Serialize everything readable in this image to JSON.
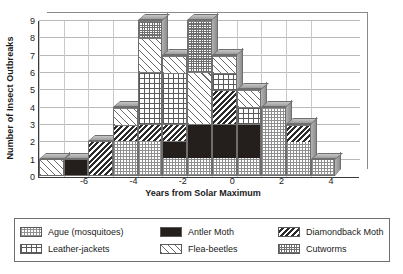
{
  "chart_data": {
    "type": "bar",
    "subtype": "stacked-bar",
    "title": "",
    "xlabel": "Years from Solar Maximum",
    "ylabel": "Number of Insect Outbreaks",
    "xlim": [
      -7.5,
      5.5
    ],
    "ylim": [
      0,
      9
    ],
    "ytick_labels": [
      "0",
      "1",
      "2",
      "3",
      "4",
      "5",
      "6",
      "7",
      "8",
      "9"
    ],
    "ytick_values": [
      0,
      1,
      2,
      3,
      4,
      5,
      6,
      7,
      8,
      9
    ],
    "xtick_labels": [
      "-6",
      "-4",
      "-2",
      "0",
      "2",
      "4"
    ],
    "xtick_values": [
      -6,
      -4,
      -2,
      0,
      2,
      4
    ],
    "categories": [
      -7,
      -6,
      -5,
      -4,
      -3,
      -2,
      -1,
      0,
      1,
      2,
      3,
      4
    ],
    "grid": "horizontal-and-vertical",
    "legend_position": "below-plot",
    "series": [
      {
        "name": "Ague (mosquitoes)",
        "pattern": "fine-checkerboard",
        "values": [
          0,
          0,
          0,
          2,
          2,
          1,
          1,
          1,
          1,
          4,
          2,
          1
        ]
      },
      {
        "name": "Antler Moth",
        "pattern": "solid-black",
        "values": [
          0,
          1,
          0,
          0,
          0,
          1,
          2,
          2,
          2,
          0,
          0,
          0
        ]
      },
      {
        "name": "Diamondback Moth",
        "pattern": "dense-diagonal-hatch",
        "values": [
          0,
          0,
          2,
          1,
          1,
          1,
          0,
          2,
          0,
          0,
          1,
          0
        ]
      },
      {
        "name": "Leather-jackets",
        "pattern": "grid-crosshatch",
        "values": [
          0,
          0,
          0,
          0,
          3,
          3,
          0,
          1,
          1,
          0,
          0,
          0
        ]
      },
      {
        "name": "Flea-beetles",
        "pattern": "sparse-diagonal-stripe",
        "values": [
          1,
          0,
          0,
          1,
          2,
          1,
          3,
          1,
          1,
          0,
          0,
          0
        ]
      },
      {
        "name": "Cutworms",
        "pattern": "dense-checkerboard",
        "values": [
          0,
          0,
          0,
          0,
          1,
          0,
          3,
          0,
          0,
          0,
          0,
          0
        ]
      }
    ],
    "stack_order_bottom_to_top": [
      "Ague (mosquitoes)",
      "Antler Moth",
      "Diamondback Moth",
      "Leather-jackets",
      "Flea-beetles",
      "Cutworms"
    ],
    "bars": [
      {
        "x": -7,
        "total": 1,
        "segments": [
          {
            "series": "Flea-beetles",
            "value": 1
          }
        ]
      },
      {
        "x": -6,
        "total": 1,
        "segments": [
          {
            "series": "Antler Moth",
            "value": 1
          }
        ]
      },
      {
        "x": -5,
        "total": 2,
        "segments": [
          {
            "series": "Diamondback Moth",
            "value": 2
          }
        ]
      },
      {
        "x": -4,
        "total": 4,
        "segments": [
          {
            "series": "Ague (mosquitoes)",
            "value": 2
          },
          {
            "series": "Diamondback Moth",
            "value": 1
          },
          {
            "series": "Flea-beetles",
            "value": 1
          }
        ]
      },
      {
        "x": -3,
        "total": 9,
        "segments": [
          {
            "series": "Ague (mosquitoes)",
            "value": 2
          },
          {
            "series": "Diamondback Moth",
            "value": 1
          },
          {
            "series": "Leather-jackets",
            "value": 3
          },
          {
            "series": "Flea-beetles",
            "value": 2
          },
          {
            "series": "Cutworms",
            "value": 1
          }
        ]
      },
      {
        "x": -2,
        "total": 7,
        "segments": [
          {
            "series": "Ague (mosquitoes)",
            "value": 1
          },
          {
            "series": "Antler Moth",
            "value": 1
          },
          {
            "series": "Diamondback Moth",
            "value": 1
          },
          {
            "series": "Leather-jackets",
            "value": 3
          },
          {
            "series": "Flea-beetles",
            "value": 1
          }
        ]
      },
      {
        "x": -1,
        "total": 9,
        "segments": [
          {
            "series": "Ague (mosquitoes)",
            "value": 1
          },
          {
            "series": "Antler Moth",
            "value": 2
          },
          {
            "series": "Flea-beetles",
            "value": 3
          },
          {
            "series": "Cutworms",
            "value": 3
          }
        ]
      },
      {
        "x": 0,
        "total": 7,
        "segments": [
          {
            "series": "Ague (mosquitoes)",
            "value": 1
          },
          {
            "series": "Antler Moth",
            "value": 2
          },
          {
            "series": "Diamondback Moth",
            "value": 2
          },
          {
            "series": "Leather-jackets",
            "value": 1
          },
          {
            "series": "Flea-beetles",
            "value": 1
          }
        ]
      },
      {
        "x": 1,
        "total": 5,
        "segments": [
          {
            "series": "Ague (mosquitoes)",
            "value": 1
          },
          {
            "series": "Antler Moth",
            "value": 2
          },
          {
            "series": "Leather-jackets",
            "value": 1
          },
          {
            "series": "Flea-beetles",
            "value": 1
          }
        ]
      },
      {
        "x": 2,
        "total": 4,
        "segments": [
          {
            "series": "Ague (mosquitoes)",
            "value": 4
          }
        ]
      },
      {
        "x": 3,
        "total": 3,
        "segments": [
          {
            "series": "Ague (mosquitoes)",
            "value": 2
          },
          {
            "series": "Diamondback Moth",
            "value": 1
          }
        ]
      },
      {
        "x": 4,
        "total": 1,
        "segments": [
          {
            "series": "Ague (mosquitoes)",
            "value": 1
          }
        ]
      }
    ]
  },
  "legend": {
    "rows": [
      [
        {
          "label": "Ague (mosquitoes)",
          "pattern": "p-ague"
        },
        {
          "label": "Antler Moth",
          "pattern": "p-antler"
        },
        {
          "label": "Diamondback Moth",
          "pattern": "p-diamond"
        }
      ],
      [
        {
          "label": "Leather-jackets",
          "pattern": "p-leather"
        },
        {
          "label": "Flea-beetles",
          "pattern": "p-flea"
        },
        {
          "label": "Cutworms",
          "pattern": "p-cutworms"
        }
      ]
    ]
  },
  "colors": {
    "axis": "#3a3a3a",
    "gridline": "#b9b9b9",
    "bar_outline": "#6e6e6e",
    "bar_3d_shade": "#9d9d9d",
    "background": "#ffffff",
    "text": "#1a1a1a",
    "antler_moth_fill": "#241f1d"
  }
}
